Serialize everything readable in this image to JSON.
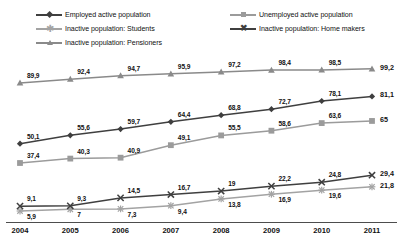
{
  "chart_data": {
    "type": "line",
    "title": "",
    "xlabel": "",
    "ylabel": "",
    "x": [
      "2004",
      "2005",
      "2006",
      "2007",
      "2008",
      "2009",
      "2010",
      "2011"
    ],
    "ylim": [
      0,
      105
    ],
    "grid": false,
    "legend_position": "top",
    "decimal_separator": ",",
    "series": [
      {
        "name": "Employed active population",
        "marker": "diamond",
        "color": "#3f3f3f",
        "values": [
          50.1,
          55.6,
          59.7,
          64.4,
          68.8,
          72.7,
          78.1,
          81.1
        ],
        "labels": [
          "50,1",
          "55,6",
          "59,7",
          "64,4",
          "68,8",
          "72,7",
          "78,1",
          "81,1"
        ],
        "end_label": "81,1"
      },
      {
        "name": "Unemployed active population",
        "marker": "square",
        "color": "#9b9b9b",
        "values": [
          37.4,
          40.3,
          40.9,
          49.1,
          55.5,
          58.6,
          63.6,
          65.0
        ],
        "labels": [
          "37,4",
          "40,3",
          "40,9",
          "49,1",
          "55,5",
          "58,6",
          "63,6",
          "65"
        ],
        "end_label": "65"
      },
      {
        "name": "Inactive population: Students",
        "marker": "asterisk",
        "color": "#a3a3a3",
        "values": [
          5.9,
          7.0,
          7.3,
          9.4,
          13.8,
          16.9,
          19.6,
          21.8
        ],
        "labels": [
          "5,9",
          "7",
          "7,3",
          "9,4",
          "13,8",
          "16,9",
          "19,6",
          "21,8"
        ],
        "end_label": "21,8"
      },
      {
        "name": "Inactive population: Home makers",
        "marker": "x",
        "color": "#3f3f3f",
        "values": [
          9.1,
          9.3,
          14.5,
          16.7,
          19.0,
          22.2,
          24.8,
          29.4
        ],
        "labels": [
          "9,1",
          "9,3",
          "14,5",
          "16,7",
          "19",
          "22,2",
          "24,8",
          "29,4"
        ],
        "end_label": "29,4"
      },
      {
        "name": "Inactive population: Pensioners",
        "marker": "triangle",
        "color": "#8a8a8a",
        "values": [
          89.9,
          92.4,
          94.7,
          95.9,
          97.2,
          98.4,
          98.5,
          99.2
        ],
        "labels": [
          "89,9",
          "92,4",
          "94,7",
          "95,9",
          "97,2",
          "98,4",
          "98,5",
          "99,2"
        ],
        "end_label": "99,2"
      }
    ]
  },
  "legend": {
    "items": [
      {
        "label": "Employed active population",
        "marker": "diamond",
        "color": "#3f3f3f"
      },
      {
        "label": "Unemployed active population",
        "marker": "square",
        "color": "#9b9b9b"
      },
      {
        "label": "Inactive population: Students",
        "marker": "asterisk",
        "color": "#a3a3a3"
      },
      {
        "label": "Inactive population: Home makers",
        "marker": "x",
        "color": "#3f3f3f"
      },
      {
        "label": "Inactive population: Pensioners",
        "marker": "triangle",
        "color": "#8a8a8a"
      }
    ]
  },
  "axis": {
    "line_color": "#4d4d4d",
    "ticks": [
      "2004",
      "2005",
      "2006",
      "2007",
      "2008",
      "2009",
      "2010",
      "2011"
    ]
  }
}
